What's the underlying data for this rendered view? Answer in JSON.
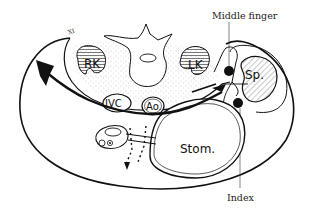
{
  "diagram": {
    "type": "anatomical cross-section",
    "labels": {
      "middle_finger": "Middle finger",
      "index": "Index",
      "right_kidney": "RK",
      "left_kidney": "LK",
      "spleen": "Sp.",
      "ivc": "IVC",
      "aorta": "Ao.",
      "stomach": "Stom."
    },
    "colors": {
      "line": "#111111",
      "background": "#ffffff",
      "stipple": "#bbbbbb",
      "hatch": "#555555"
    }
  }
}
